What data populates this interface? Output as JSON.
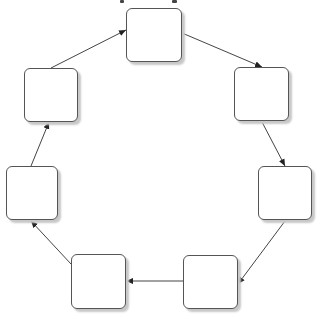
{
  "diagram": {
    "type": "cycle",
    "title_visible": false,
    "colors": {
      "border": "#555555",
      "shadow": "#c8c8c8",
      "edge": "#333333",
      "background": "#ffffff"
    },
    "nodes": [
      {
        "id": "n1",
        "label": "",
        "x": 126,
        "y": 8,
        "w": 56,
        "h": 54
      },
      {
        "id": "n2",
        "label": "",
        "x": 234,
        "y": 67,
        "w": 55,
        "h": 54
      },
      {
        "id": "n3",
        "label": "",
        "x": 258,
        "y": 166,
        "w": 54,
        "h": 54
      },
      {
        "id": "n4",
        "label": "",
        "x": 183,
        "y": 255,
        "w": 55,
        "h": 54
      },
      {
        "id": "n5",
        "label": "",
        "x": 71,
        "y": 254,
        "w": 55,
        "h": 55
      },
      {
        "id": "n6",
        "label": "",
        "x": 6,
        "y": 166,
        "w": 52,
        "h": 54
      },
      {
        "id": "n7",
        "label": "",
        "x": 24,
        "y": 68,
        "w": 54,
        "h": 54
      }
    ],
    "edges": [
      {
        "from": "n1",
        "to": "n2"
      },
      {
        "from": "n2",
        "to": "n3"
      },
      {
        "from": "n3",
        "to": "n4"
      },
      {
        "from": "n4",
        "to": "n5"
      },
      {
        "from": "n5",
        "to": "n6"
      },
      {
        "from": "n6",
        "to": "n7"
      },
      {
        "from": "n7",
        "to": "n1"
      }
    ]
  }
}
